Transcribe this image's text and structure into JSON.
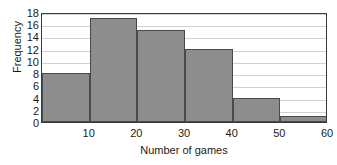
{
  "chart_data": {
    "type": "bar",
    "title": "",
    "subtitle": "",
    "xlabel": "Number of games",
    "ylabel": "Frequency",
    "categories": [
      "0-10",
      "10-20",
      "20-30",
      "30-40",
      "40-50",
      "50-60"
    ],
    "bin_edges": [
      0,
      10,
      20,
      30,
      40,
      50,
      60
    ],
    "values": [
      8,
      17,
      15,
      12,
      4,
      1
    ],
    "x_tick_labels": [
      "10",
      "20",
      "30",
      "40",
      "50",
      "60"
    ],
    "x_tick_values": [
      10,
      20,
      30,
      40,
      50,
      60
    ],
    "y_tick_labels": [
      "0",
      "2",
      "4",
      "6",
      "8",
      "10",
      "12",
      "14",
      "16",
      "18"
    ],
    "y_tick_values": [
      0,
      2,
      4,
      6,
      8,
      10,
      12,
      14,
      16,
      18
    ],
    "xlim": [
      0,
      60
    ],
    "ylim": [
      0,
      18
    ],
    "grid": true,
    "grid_axis": "y",
    "legend": false,
    "legend_position": "none",
    "bar_fill_color": "#8d8d8d",
    "bar_edge_color": "#4a4a4a",
    "grid_color": "#d2d2d2",
    "axis_color": "#3a3a3a",
    "text_color": "#1a1a1a",
    "background_color": "#ffffff"
  }
}
